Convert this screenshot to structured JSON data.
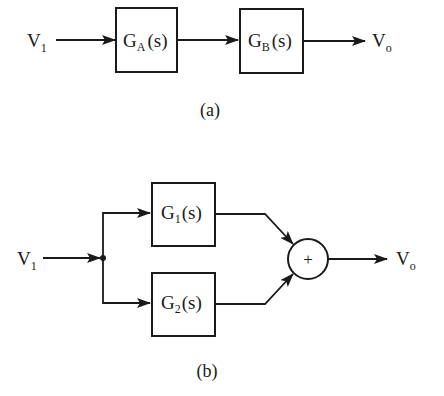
{
  "diagram_a": {
    "caption": "(a)",
    "input": {
      "symbol": "V",
      "subscript": "1"
    },
    "output": {
      "symbol": "V",
      "subscript": "o"
    },
    "blocks": [
      {
        "symbol": "G",
        "subscript": "A",
        "arg": "(s)"
      },
      {
        "symbol": "G",
        "subscript": "B",
        "arg": "(s)"
      }
    ],
    "connection": "series"
  },
  "diagram_b": {
    "caption": "(b)",
    "input": {
      "symbol": "V",
      "subscript": "1"
    },
    "output": {
      "symbol": "V",
      "subscript": "o"
    },
    "blocks": [
      {
        "symbol": "G",
        "subscript": "1",
        "arg": "(s)"
      },
      {
        "symbol": "G",
        "subscript": "2",
        "arg": "(s)"
      }
    ],
    "summing_junction": {
      "sign": "+"
    },
    "connection": "parallel"
  }
}
